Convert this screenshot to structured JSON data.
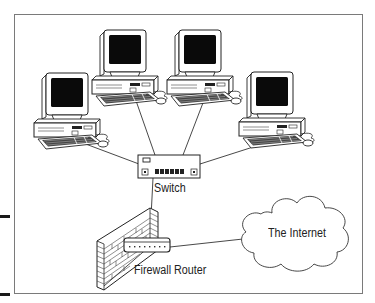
{
  "diagram": {
    "type": "network-topology",
    "nodes": [
      {
        "id": "pc1",
        "kind": "computer",
        "label": ""
      },
      {
        "id": "pc2",
        "kind": "computer",
        "label": ""
      },
      {
        "id": "pc3",
        "kind": "computer",
        "label": ""
      },
      {
        "id": "pc4",
        "kind": "computer",
        "label": ""
      },
      {
        "id": "switch",
        "kind": "switch",
        "label": "Switch"
      },
      {
        "id": "firewall_router",
        "kind": "firewall-router",
        "label": "Firewall Router"
      },
      {
        "id": "internet",
        "kind": "cloud",
        "label": "The Internet"
      }
    ],
    "edges": [
      {
        "from": "pc1",
        "to": "switch"
      },
      {
        "from": "pc2",
        "to": "switch"
      },
      {
        "from": "pc3",
        "to": "switch"
      },
      {
        "from": "pc4",
        "to": "switch"
      },
      {
        "from": "switch",
        "to": "firewall_router"
      },
      {
        "from": "firewall_router",
        "to": "internet"
      }
    ]
  },
  "labels": {
    "switch": "Switch",
    "firewall_router": "Firewall Router",
    "internet": "The Internet"
  },
  "colors": {
    "frame": "#7a7a7a",
    "line": "#333333",
    "screen": "#0a0a0a",
    "tick": "#1a1a1a"
  }
}
